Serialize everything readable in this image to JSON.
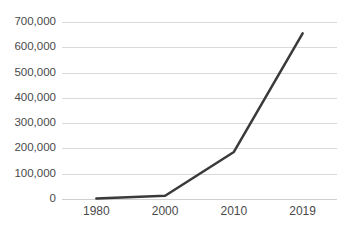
{
  "chart_data": {
    "type": "line",
    "title": "",
    "subtitle": "",
    "xlabel": "",
    "ylabel": "",
    "categories": [
      "1980",
      "2000",
      "2010",
      "2019"
    ],
    "values": [
      2000,
      13000,
      186000,
      655000
    ],
    "series": [
      {
        "name": "",
        "values": [
          2000,
          13000,
          186000,
          655000
        ]
      }
    ],
    "ylim": [
      0,
      700000
    ],
    "ytick_values": [
      0,
      100000,
      200000,
      300000,
      400000,
      500000,
      600000,
      700000
    ],
    "ytick_labels": [
      "0",
      "100,000",
      "200,000",
      "300,000",
      "400,000",
      "500,000",
      "600,000",
      "700,000"
    ],
    "xtick_labels": [
      "1980",
      "2000",
      "2010",
      "2019"
    ],
    "grid": true,
    "grid_axis": "y",
    "legend": false,
    "legend_position": "none",
    "markers": false,
    "annotations": []
  },
  "style": {
    "line_color": "#3a3a3a",
    "line_width": 2.5,
    "grid_color": "#d9d9d9",
    "axis_color": "#d0d0d0",
    "tick_label_color": "#4a4a4a",
    "background": "#ffffff"
  }
}
